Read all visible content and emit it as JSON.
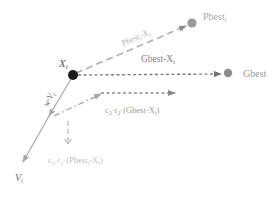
{
  "diagram": {
    "colors": {
      "background": "#ffffff",
      "particle": "#1a1a1a",
      "pbest": "#9a9a9a",
      "gbest": "#8c8c8c",
      "pbest_line": "#b8b8b8",
      "gbest_line": "#7a7a7a",
      "velocity_line": "#a6a6a6",
      "label_dark": "#555555",
      "label_light": "#a8a8a8"
    },
    "nodes": {
      "xi": {
        "label": "X",
        "sub": "i",
        "x": 73,
        "y": 75
      },
      "pbest": {
        "label": "Pbest",
        "sub": "i",
        "x": 192,
        "y": 23
      },
      "gbest": {
        "label": "Gbest",
        "x": 228,
        "y": 73
      }
    },
    "edge_labels": {
      "pbest_minus_x": {
        "main": "Pbest",
        "sub1": "i",
        "mid": "-X",
        "sub2": "i"
      },
      "gbest_minus_x": {
        "main": "Gbest-X",
        "sub": "i"
      },
      "inertia": {
        "main": "w·V",
        "sub": "i"
      },
      "social": {
        "pre": "c",
        "s1": "2",
        "mid": "·r",
        "s2": "2",
        "post": "·(Gbest-X",
        "s3": "i",
        "end": ")"
      },
      "cognitive": {
        "pre": "c",
        "s1": "1",
        "mid": "·r",
        "s2": "1",
        "post": "·(Pbest",
        "s3": "i",
        "mid2": "-X",
        "s4": "i",
        "end": ")"
      },
      "velocity": {
        "main": "V",
        "sub": "i"
      }
    }
  }
}
